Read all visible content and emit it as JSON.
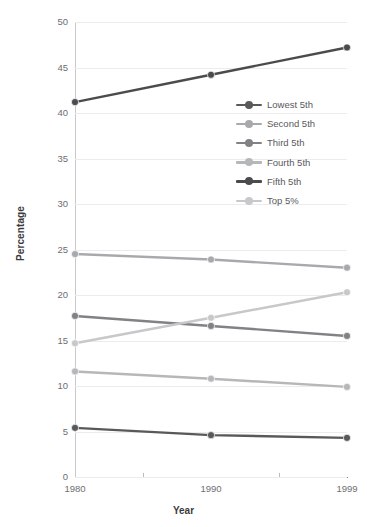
{
  "chart_data": {
    "type": "line",
    "title": "",
    "xlabel": "Year",
    "ylabel": "Percentage",
    "categories": [
      "1980",
      "1990",
      "1999"
    ],
    "x": [
      1980,
      1990,
      1999
    ],
    "xlim": [
      1980,
      1999
    ],
    "ylim": [
      0,
      50
    ],
    "yticks": [
      0,
      5,
      10,
      15,
      20,
      25,
      30,
      35,
      40,
      45,
      50
    ],
    "ytick_labels": [
      "0",
      "5",
      "10",
      "15",
      "20",
      "25",
      "30",
      "35",
      "40",
      "45",
      "50"
    ],
    "xtick_labels": [
      "1980",
      "1990",
      "1999"
    ],
    "grid": true,
    "legend_position": "center-right",
    "series": [
      {
        "name": "Lowest 5th",
        "values": [
          5.4,
          4.6,
          4.3
        ],
        "color": "#58595b"
      },
      {
        "name": "Second 5th",
        "values": [
          24.5,
          23.9,
          23.0
        ],
        "color": "#a7a9ac"
      },
      {
        "name": "Third 5th",
        "values": [
          17.7,
          16.6,
          15.5
        ],
        "color": "#808285"
      },
      {
        "name": "Fourth 5th",
        "values": [
          11.6,
          10.8,
          9.9
        ],
        "color": "#b5b7b9"
      },
      {
        "name": "Fifth 5th",
        "values": [
          41.2,
          44.2,
          47.2
        ],
        "color": "#4a4b4d"
      },
      {
        "name": "Top 5%",
        "values": [
          14.7,
          17.5,
          20.3
        ],
        "color": "#c6c8ca"
      }
    ]
  },
  "axes": {
    "y_title": "Percentage",
    "x_title": "Year"
  },
  "colors": {
    "gridline": "#ececed",
    "axis": "#8b8c8e",
    "text": "#58595b",
    "background": "#ffffff"
  }
}
